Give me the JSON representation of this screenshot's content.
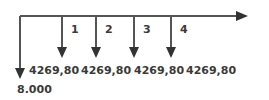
{
  "diagram": {
    "type": "cash-flow-timeline",
    "line_color": "#555555",
    "initial_outflow": {
      "value": "8.000",
      "direction": "down"
    },
    "periods": [
      {
        "label": "1",
        "amount": "4269,80"
      },
      {
        "label": "2",
        "amount": "4269,80"
      },
      {
        "label": "3",
        "amount": "4269,80"
      },
      {
        "label": "4",
        "amount": "4269,80"
      }
    ]
  }
}
